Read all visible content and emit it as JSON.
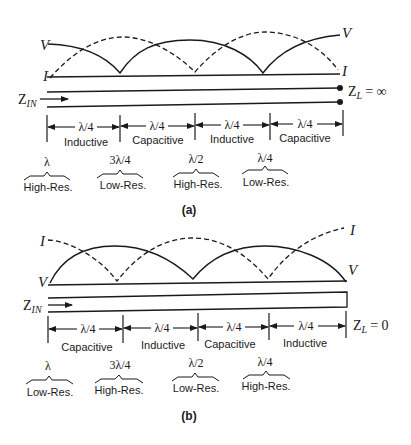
{
  "figure_a": {
    "caption": "(a)",
    "curve_labels": {
      "v_left": "V",
      "i_left": "I",
      "v_right": "V",
      "i_right": "I"
    },
    "input_label": {
      "z": "Z",
      "sub": "IN"
    },
    "load_label": {
      "z": "Z",
      "sub": "L",
      "eq": "= ∞"
    },
    "segments": [
      {
        "length": "λ/4",
        "type": "Inductive"
      },
      {
        "length": "λ/4",
        "type": "Capacitive"
      },
      {
        "length": "λ/4",
        "type": "Inductive"
      },
      {
        "length": "λ/4",
        "type": "Capacitive"
      }
    ],
    "resonances": [
      {
        "length": "λ",
        "type": "High-Res."
      },
      {
        "length": "3λ/4",
        "type": "Low-Res."
      },
      {
        "length": "λ/2",
        "type": "High-Res."
      },
      {
        "length": "λ/4",
        "type": "Low-Res."
      }
    ]
  },
  "figure_b": {
    "caption": "(b)",
    "curve_labels": {
      "i_left": "I",
      "v_left": "V",
      "i_right": "I",
      "v_right": "V"
    },
    "input_label": {
      "z": "Z",
      "sub": "IN"
    },
    "load_label": {
      "z": "Z",
      "sub": "L",
      "eq": "= 0"
    },
    "segments": [
      {
        "length": "λ/4",
        "type": "Capacitive"
      },
      {
        "length": "λ/4",
        "type": "Inductive"
      },
      {
        "length": "λ/4",
        "type": "Capacitive"
      },
      {
        "length": "λ/4",
        "type": "Inductive"
      }
    ],
    "resonances": [
      {
        "length": "λ",
        "type": "Low-Res."
      },
      {
        "length": "3λ/4",
        "type": "High-Res."
      },
      {
        "length": "λ/2",
        "type": "Low-Res."
      },
      {
        "length": "λ/4",
        "type": "High-Res."
      }
    ]
  },
  "colors": {
    "ink": "#1a1a1a",
    "background": "#ffffff"
  }
}
